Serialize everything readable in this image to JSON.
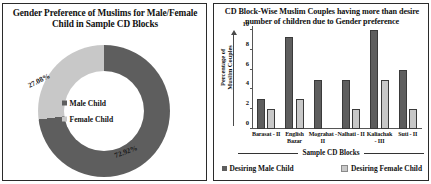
{
  "colors": {
    "male": "#5e5e5e",
    "female": "#c8c8c8",
    "border": "#2b2b2b",
    "axis": "#555555",
    "text": "#111111"
  },
  "pie_panel": {
    "title": "Gender Preference of Muslims for Male/Female Child in Sample CD Blocks",
    "legend": [
      {
        "label": "Male Child",
        "color": "#5e5e5e"
      },
      {
        "label": "Female Child",
        "color": "#c8c8c8"
      }
    ],
    "labels": {
      "male_pct": "72.92%",
      "female_pct": "27.08%"
    }
  },
  "bar_panel": {
    "title": "CD Block-Wise Muslim Couples having more than desire number of children due to Gender preference",
    "yaxis_title_line1": "Percentage of",
    "yaxis_title_line2": "Muslim Couples",
    "xaxis_title": "Sample CD Blocks",
    "legend": [
      {
        "label": "Desiring Male Child",
        "color": "#5e5e5e"
      },
      {
        "label": "Desiring Female Child",
        "color": "#c8c8c8"
      }
    ]
  },
  "chart_data": [
    {
      "type": "pie",
      "title": "Gender Preference of Muslims for Male/Female Child in Sample CD Blocks",
      "subtype": "doughnut",
      "labels": [
        "Male Child",
        "Female Child"
      ],
      "values": [
        72.92,
        27.08
      ],
      "value_labels": [
        "72.92%",
        "27.08%"
      ],
      "colors": [
        "#5e5e5e",
        "#c8c8c8"
      ],
      "legend_position": "center",
      "units": "percent"
    },
    {
      "type": "bar",
      "title": "CD Block-Wise Muslim Couples having more than desire number of children due to Gender preference",
      "categories": [
        "Barasat - II",
        "English Bazar",
        "Mograhat - II",
        "Nalhati - II",
        "Kaliachak - III",
        "Suti - II"
      ],
      "series": [
        {
          "name": "Desiring Male Child",
          "values": [
            3,
            9.3,
            5,
            5,
            10,
            6
          ],
          "color": "#5e5e5e"
        },
        {
          "name": "Desiring Female Child",
          "values": [
            2,
            3,
            0,
            2,
            5,
            2
          ],
          "color": "#c8c8c8"
        }
      ],
      "xlabel": "Sample CD Blocks",
      "ylabel": "Percentage of Muslim Couples",
      "ylim": [
        0,
        10
      ],
      "yticks": [
        0,
        2,
        4,
        6,
        8,
        10
      ],
      "grid": false,
      "legend_position": "bottom"
    }
  ]
}
